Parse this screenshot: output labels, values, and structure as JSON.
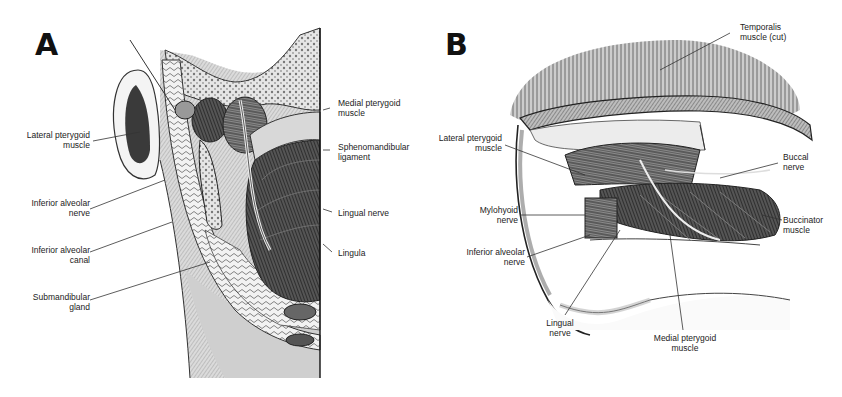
{
  "figure": {
    "panels": [
      {
        "id": "A",
        "letter": "A",
        "view": "coronal section of the mandibular region",
        "labels": [
          {
            "key": "lateral_pterygoid_muscle",
            "lines": [
              "Lateral pterygoid",
              "muscle"
            ]
          },
          {
            "key": "inferior_alveolar_nerve",
            "lines": [
              "Inferior alveolar",
              "nerve"
            ]
          },
          {
            "key": "inferior_alveolar_canal",
            "lines": [
              "Inferior alveolar",
              "canal"
            ]
          },
          {
            "key": "submandibular_gland",
            "lines": [
              "Submandibular",
              "gland"
            ]
          },
          {
            "key": "medial_pterygoid_muscle",
            "lines": [
              "Medial pterygoid",
              "muscle"
            ]
          },
          {
            "key": "sphenomandibular_ligament",
            "lines": [
              "Sphenomandibular",
              "ligament"
            ]
          },
          {
            "key": "lingual_nerve",
            "lines": [
              "Lingual nerve"
            ]
          },
          {
            "key": "lingula",
            "lines": [
              "Lingula"
            ]
          }
        ]
      },
      {
        "id": "B",
        "letter": "B",
        "view": "lateral view of the infratemporal region",
        "labels": [
          {
            "key": "temporalis_muscle_cut",
            "lines": [
              "Temporalis",
              "muscle (cut)"
            ]
          },
          {
            "key": "lateral_pterygoid_muscle",
            "lines": [
              "Lateral pterygoid",
              "muscle"
            ]
          },
          {
            "key": "buccal_nerve",
            "lines": [
              "Buccal",
              "nerve"
            ]
          },
          {
            "key": "mylohyoid_nerve",
            "lines": [
              "Mylohyoid",
              "nerve"
            ]
          },
          {
            "key": "buccinator_muscle",
            "lines": [
              "Buccinator",
              "muscle"
            ]
          },
          {
            "key": "inferior_alveolar_nerve",
            "lines": [
              "Inferior alveolar",
              "nerve"
            ]
          },
          {
            "key": "lingual_nerve",
            "lines": [
              "Lingual",
              "nerve"
            ]
          },
          {
            "key": "medial_pterygoid_muscle",
            "lines": [
              "Medial pterygoid",
              "muscle"
            ]
          }
        ]
      }
    ]
  }
}
